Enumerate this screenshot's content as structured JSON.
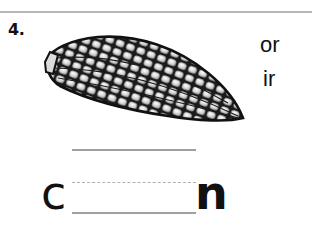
{
  "worksheet": {
    "item_number": "4.",
    "picture": "corn-cob-icon",
    "choices": [
      "or",
      "ir"
    ],
    "word": {
      "prefix": "c",
      "blank": "",
      "suffix": "n"
    },
    "colors": {
      "ink": "#111111",
      "rule": "#b8b8b8",
      "line": "#a0a0a0"
    }
  }
}
